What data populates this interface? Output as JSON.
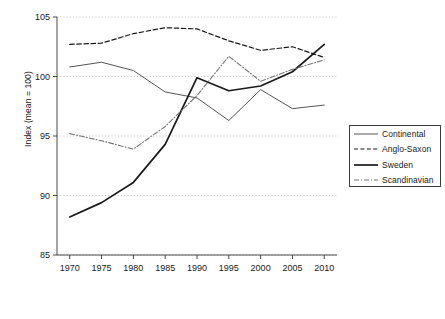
{
  "chart_data": {
    "type": "line",
    "title": "",
    "xlabel": "",
    "ylabel": "Index (mean = 100)",
    "x": [
      1970,
      1975,
      1980,
      1985,
      1990,
      1995,
      2000,
      2005,
      2010
    ],
    "xticks": [
      "1970",
      "1975",
      "1980",
      "1985",
      "1990",
      "1995",
      "2000",
      "2005",
      "2010"
    ],
    "yticks": [
      "85",
      "90",
      "95",
      "100",
      "105"
    ],
    "xlim": [
      1968,
      2012
    ],
    "ylim": [
      85,
      105
    ],
    "grid": "horizontal-dotted",
    "legend_position": "right-outside",
    "series": [
      {
        "name": "Continental",
        "style": "solid-thin",
        "color": "#555555",
        "values": [
          100.8,
          101.2,
          100.5,
          98.7,
          98.2,
          96.3,
          98.9,
          97.3,
          97.6
        ]
      },
      {
        "name": "Anglo-Saxon",
        "style": "dashed",
        "color": "#1a1a1a",
        "values": [
          102.7,
          102.8,
          103.6,
          104.1,
          104.0,
          103.0,
          102.2,
          102.5,
          101.6
        ]
      },
      {
        "name": "Sweden",
        "style": "solid-thick",
        "color": "#1a1a1a",
        "values": [
          88.2,
          89.4,
          91.1,
          94.3,
          99.9,
          98.8,
          99.2,
          100.4,
          102.7
        ]
      },
      {
        "name": "Scandinavian",
        "style": "dash-dot",
        "color": "#777777",
        "values": [
          95.2,
          94.6,
          93.9,
          95.8,
          98.4,
          101.7,
          99.6,
          100.6,
          101.4
        ]
      }
    ]
  },
  "legend": {
    "items": [
      {
        "label": "Continental"
      },
      {
        "label": "Anglo-Saxon"
      },
      {
        "label": "Sweden"
      },
      {
        "label": "Scandinavian"
      }
    ]
  }
}
